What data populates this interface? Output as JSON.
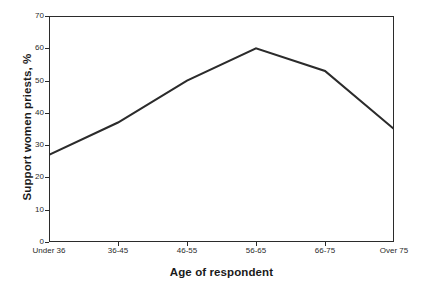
{
  "chart_data": {
    "type": "line",
    "title": "",
    "subtitle": "",
    "xlabel": "Age of respondent",
    "ylabel": "Support women priests, %",
    "categories": [
      "Under 36",
      "36-45",
      "46-55",
      "56-65",
      "66-75",
      "Over 75"
    ],
    "values": [
      27,
      37,
      50,
      60,
      53,
      35
    ],
    "series": [
      {
        "name": "Support women priests",
        "values": [
          27,
          37,
          50,
          60,
          53,
          35
        ]
      }
    ],
    "ylim": [
      0,
      70
    ],
    "ytick_values": [
      0,
      10,
      20,
      30,
      40,
      50,
      60,
      70
    ],
    "ytick_labels": [
      "0",
      "10",
      "20",
      "30",
      "40",
      "50",
      "60",
      "70"
    ],
    "xtick_labels": [
      "Under 36",
      "36-45",
      "46-55",
      "56-65",
      "66-75",
      "Over 75"
    ],
    "grid": false,
    "legend": false,
    "legend_position": "none",
    "line_color": "#2b2b2b",
    "background_color": "#ffffff",
    "axis_color": "#2b2b2b",
    "markers": false
  }
}
